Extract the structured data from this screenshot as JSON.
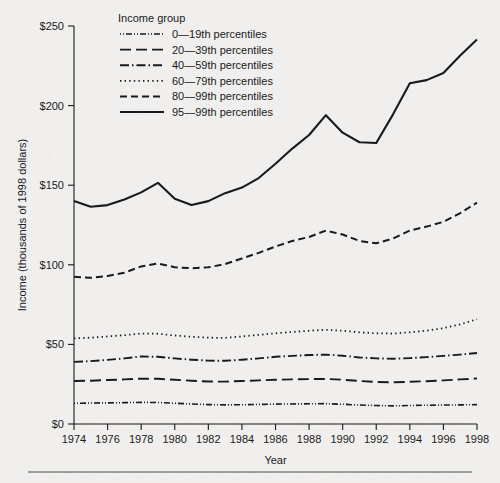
{
  "figure": {
    "background_color": "#f0efed",
    "ink_color": "#1a1a1a",
    "footer_rule": true
  },
  "legend": {
    "title": "Income group",
    "position": "top-left-inside"
  },
  "axis": {
    "x_title": "Year",
    "y_title": "Income (thousands of 1998 dollars)",
    "y_tick_labels": [
      "$0",
      "$50",
      "$100",
      "$150",
      "$200",
      "$250"
    ],
    "x_tick_labels": [
      "1974",
      "1976",
      "1978",
      "1980",
      "1982",
      "1984",
      "1986",
      "1988",
      "1990",
      "1992",
      "1994",
      "1996",
      "1998"
    ]
  },
  "chart_data": {
    "type": "line",
    "title": "",
    "xlabel": "Year",
    "ylabel": "Income (thousands of 1998 dollars)",
    "xlim": [
      1974,
      1998
    ],
    "ylim": [
      0,
      250
    ],
    "yticks": [
      0,
      50,
      100,
      150,
      200,
      250
    ],
    "ytick_labels": [
      "$0",
      "$50",
      "$100",
      "$150",
      "$200",
      "$250"
    ],
    "xticks": [
      1974,
      1976,
      1978,
      1980,
      1982,
      1984,
      1986,
      1988,
      1990,
      1992,
      1994,
      1996,
      1998
    ],
    "grid": false,
    "legend_title": "Income group",
    "legend_position": "upper left inside",
    "x": [
      1974,
      1975,
      1976,
      1977,
      1978,
      1979,
      1980,
      1981,
      1982,
      1983,
      1984,
      1985,
      1986,
      1987,
      1988,
      1989,
      1990,
      1991,
      1992,
      1993,
      1994,
      1995,
      1996,
      1997,
      1998
    ],
    "series": [
      {
        "name": "0—19th percentiles",
        "dash": "dash-dot-dot",
        "stroke_width": 1.6,
        "dasharray": "1,2,1,2,6,2",
        "values": [
          13.0,
          13.2,
          13.3,
          13.4,
          13.6,
          13.5,
          13.0,
          12.6,
          12.2,
          12.0,
          12.1,
          12.3,
          12.5,
          12.6,
          12.7,
          12.8,
          12.4,
          11.9,
          11.6,
          11.4,
          11.6,
          11.8,
          11.9,
          12.0,
          12.2
        ]
      },
      {
        "name": "20—39th percentiles",
        "dash": "long-dash",
        "stroke_width": 1.9,
        "dasharray": "11,5",
        "values": [
          27.0,
          27.2,
          27.6,
          28.0,
          28.5,
          28.4,
          27.8,
          27.2,
          26.7,
          26.6,
          27.0,
          27.4,
          27.8,
          28.0,
          28.2,
          28.3,
          27.8,
          27.0,
          26.4,
          26.2,
          26.5,
          26.9,
          27.4,
          28.0,
          28.6
        ]
      },
      {
        "name": "40—59th percentiles",
        "dash": "dash-dot",
        "stroke_width": 1.9,
        "dasharray": "9,3,1.5,3",
        "values": [
          39.0,
          39.5,
          40.3,
          41.2,
          42.4,
          42.2,
          41.2,
          40.4,
          39.8,
          39.7,
          40.4,
          41.2,
          42.2,
          42.8,
          43.3,
          43.6,
          42.9,
          41.8,
          41.2,
          41.0,
          41.4,
          42.0,
          42.8,
          43.6,
          44.6
        ]
      },
      {
        "name": "60—79th percentiles",
        "dash": "dotted",
        "stroke_width": 1.8,
        "dasharray": "1.4,3.2",
        "values": [
          53.8,
          54.2,
          55.0,
          55.8,
          56.8,
          56.7,
          55.6,
          54.8,
          54.2,
          54.1,
          55.0,
          56.0,
          57.0,
          57.8,
          58.6,
          59.2,
          58.6,
          57.6,
          57.0,
          56.8,
          57.6,
          58.6,
          60.2,
          62.6,
          65.8
        ]
      },
      {
        "name": "80—99th percentiles",
        "dash": "dashed",
        "stroke_width": 2.0,
        "dasharray": "7,4",
        "values": [
          92.5,
          91.8,
          93.0,
          95.0,
          99.0,
          100.8,
          98.5,
          97.8,
          98.4,
          100.5,
          104.0,
          107.5,
          111.5,
          115.0,
          117.5,
          121.5,
          119.0,
          115.0,
          113.5,
          116.5,
          121.5,
          124.0,
          127.0,
          132.5,
          139.0
        ]
      },
      {
        "name": "95—99th percentiles",
        "dash": "solid",
        "stroke_width": 2.1,
        "dasharray": "",
        "values": [
          140.0,
          136.5,
          137.5,
          141.0,
          145.5,
          151.5,
          141.5,
          137.5,
          140.0,
          145.0,
          148.5,
          154.5,
          163.5,
          173.0,
          181.5,
          194.0,
          183.0,
          177.0,
          176.5,
          194.5,
          214.0,
          216.0,
          220.5,
          231.5,
          241.5
        ]
      }
    ]
  }
}
